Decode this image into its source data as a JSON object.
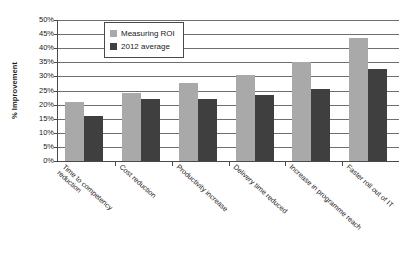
{
  "chart_data": {
    "type": "bar",
    "title": "",
    "xlabel": "",
    "ylabel": "% Improvement",
    "ylim": [
      0,
      50
    ],
    "ytick_labels": [
      "50%",
      "45%",
      "40%",
      "35%",
      "30%",
      "25%",
      "20%",
      "15%",
      "10%",
      "5%",
      "0%"
    ],
    "ytick_values": [
      50,
      45,
      40,
      35,
      30,
      25,
      20,
      15,
      10,
      5,
      0
    ],
    "grid": true,
    "legend_position": "top-left-inside",
    "categories": [
      "Time to competency\nreduction",
      "Cost reduction",
      "Productivity increase",
      "Delivery time reduced",
      "Increase in programme reach",
      "Faster roll out of IT"
    ],
    "series": [
      {
        "name": "Measuring ROI",
        "color": "#a9a9a9",
        "values": [
          21,
          24,
          27.5,
          30.5,
          35,
          43.5
        ]
      },
      {
        "name": "2012 average",
        "color": "#3f3f3f",
        "values": [
          16,
          22,
          22,
          23.5,
          25.5,
          32.5
        ]
      }
    ]
  },
  "axis": {
    "y_title": "% Improvement"
  }
}
